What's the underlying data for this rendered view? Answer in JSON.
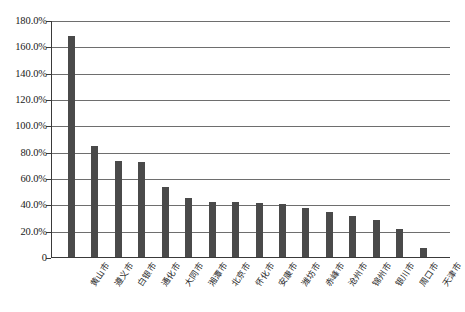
{
  "chart_data": {
    "type": "bar",
    "title": "",
    "xlabel": "",
    "ylabel": "",
    "ylim": [
      0,
      180
    ],
    "grid": true,
    "legend": "none",
    "yticks": [
      "0",
      "20.0%",
      "40.0%",
      "60.0%",
      "80.0%",
      "100.0%",
      "120.0%",
      "140.0%",
      "160.0%",
      "180.0%"
    ],
    "ytick_values": [
      0,
      20,
      40,
      60,
      80,
      100,
      120,
      140,
      160,
      180
    ],
    "categories": [
      "黄山市",
      "遵义市",
      "白银市",
      "通化市",
      "大同市",
      "湘潭市",
      "北京市",
      "怀化市",
      "安康市",
      "潍坊市",
      "赤峰市",
      "沧州市",
      "锦州市",
      "银川市",
      "周口市",
      "天津市"
    ],
    "values": [
      168,
      84,
      73,
      72,
      53,
      45,
      42,
      42,
      41,
      40,
      37,
      34,
      31,
      28,
      21,
      7
    ],
    "bar_color": "#4a4a4a",
    "gridline_color": "#6e6e6e",
    "axis_color": "#3a3a3a"
  },
  "caption": {
    "text": "图 2-7  ",
    "visible": false
  }
}
